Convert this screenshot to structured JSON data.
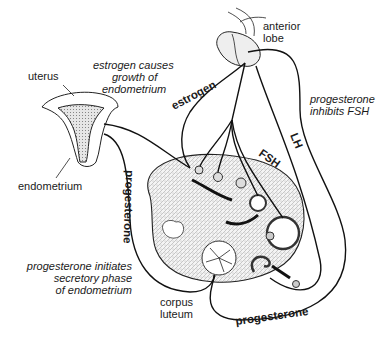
{
  "diagram": {
    "labels": {
      "anterior_lobe_1": "anterior",
      "anterior_lobe_2": "lobe",
      "uterus": "uterus",
      "endometrium": "endometrium",
      "corpus_luteum_1": "corpus",
      "corpus_luteum_2": "luteum"
    },
    "annotations": {
      "estrogen_effect_1": "estrogen causes",
      "estrogen_effect_2": "growth of",
      "estrogen_effect_3": "endometrium",
      "prog_inhibits_1": "progesterone",
      "prog_inhibits_2": "inhibits FSH",
      "prog_initiates_1": "progesterone initiates",
      "prog_initiates_2": "secretory phase",
      "prog_initiates_3": "of endometrium"
    },
    "pathways": {
      "estrogen": "estrogen",
      "fsh": "FSH",
      "lh": "LH",
      "progesterone_left": "progesterone",
      "progesterone_bottom": "progesterone"
    },
    "nodes": [
      "anterior lobe (pituitary)",
      "uterus",
      "endometrium",
      "ovary",
      "follicles",
      "corpus luteum"
    ],
    "edges": [
      {
        "from": "anterior lobe",
        "to": "ovary follicles",
        "label": "FSH"
      },
      {
        "from": "anterior lobe",
        "to": "ovary",
        "label": "LH"
      },
      {
        "from": "ovary",
        "to": "uterus",
        "label": "estrogen"
      },
      {
        "from": "ovary",
        "to": "anterior lobe",
        "label": "estrogen"
      },
      {
        "from": "corpus luteum",
        "to": "uterus",
        "label": "progesterone"
      },
      {
        "from": "corpus luteum",
        "to": "anterior lobe",
        "label": "progesterone"
      }
    ]
  }
}
